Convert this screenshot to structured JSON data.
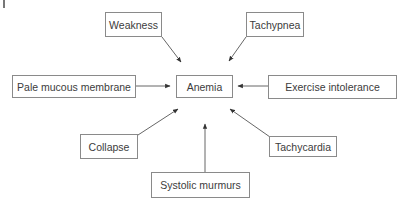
{
  "diagram": {
    "central": {
      "id": "anemia",
      "label": "Anemia"
    },
    "nodes": [
      {
        "id": "weakness",
        "label": "Weakness"
      },
      {
        "id": "tachypnea",
        "label": "Tachypnea"
      },
      {
        "id": "pale-mucous-membrane",
        "label": "Pale mucous membrane"
      },
      {
        "id": "exercise-intolerance",
        "label": "Exercise intolerance"
      },
      {
        "id": "collapse",
        "label": "Collapse"
      },
      {
        "id": "tachycardia",
        "label": "Tachycardia"
      },
      {
        "id": "systolic-murmurs",
        "label": "Systolic murmurs"
      }
    ],
    "edges": [
      {
        "from": "weakness",
        "to": "anemia"
      },
      {
        "from": "tachypnea",
        "to": "anemia"
      },
      {
        "from": "pale-mucous-membrane",
        "to": "anemia"
      },
      {
        "from": "exercise-intolerance",
        "to": "anemia"
      },
      {
        "from": "collapse",
        "to": "anemia"
      },
      {
        "from": "tachycardia",
        "to": "anemia"
      },
      {
        "from": "systolic-murmurs",
        "to": "anemia"
      }
    ],
    "colors": {
      "line": "#555555",
      "border": "#8a8a8a",
      "text": "#3c3c3c"
    }
  }
}
